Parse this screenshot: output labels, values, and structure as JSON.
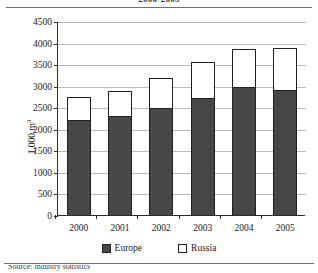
{
  "figure": {
    "title": "2000-2005",
    "caption": "Source: industry statistics"
  },
  "chart_data": {
    "type": "bar",
    "stacked": true,
    "title": "2000-2005",
    "xlabel": "",
    "ylabel": "1,000 m³",
    "categories": [
      "2000",
      "2001",
      "2002",
      "2003",
      "2004",
      "2005"
    ],
    "series": [
      {
        "name": "Europe",
        "color": "#474747",
        "values": [
          2200,
          2290,
          2480,
          2720,
          2980,
          2900
        ]
      },
      {
        "name": "Russia",
        "color": "#ffffff",
        "values": [
          530,
          590,
          690,
          830,
          860,
          980
        ]
      }
    ],
    "totals": [
      2730,
      2880,
      3170,
      3550,
      3840,
      3880
    ],
    "ylim": [
      0,
      4500
    ],
    "yticks": [
      0,
      500,
      1000,
      1500,
      2000,
      2500,
      3000,
      3500,
      4000,
      4500
    ],
    "ytick_labels": [
      "0",
      "500",
      "1000",
      "1500",
      "2000",
      "2500",
      "3000",
      "3500",
      "4000",
      "4500"
    ],
    "grid": true,
    "legend_position": "bottom"
  }
}
